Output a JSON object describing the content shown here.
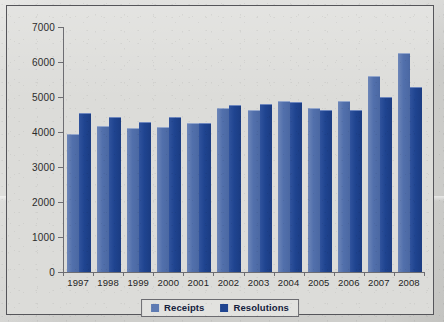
{
  "chart_data": {
    "type": "bar",
    "title": "",
    "xlabel": "",
    "ylabel": "",
    "categories": [
      "1997",
      "1998",
      "1999",
      "2000",
      "2001",
      "2002",
      "2003",
      "2004",
      "2005",
      "2006",
      "2007",
      "2008"
    ],
    "series": [
      {
        "name": "Receipts",
        "color": "#5e7bb3",
        "values": [
          3930,
          4180,
          4120,
          4130,
          4250,
          4690,
          4630,
          4880,
          4690,
          4900,
          5600,
          6270
        ]
      },
      {
        "name": "Resolutions",
        "color": "#1f4490",
        "values": [
          4540,
          4420,
          4300,
          4440,
          4250,
          4770,
          4810,
          4860,
          4620,
          4630,
          4990,
          5300
        ]
      }
    ],
    "ylim": [
      0,
      7000
    ],
    "ytick_labels": [
      "0",
      "1000",
      "2000",
      "3000",
      "4000",
      "5000",
      "6000",
      "7000"
    ],
    "ytick_values": [
      0,
      1000,
      2000,
      3000,
      4000,
      5000,
      6000,
      7000
    ],
    "grid": false,
    "legend_position": "bottom-center"
  },
  "legend": {
    "items": [
      {
        "label": "Receipts"
      },
      {
        "label": "Resolutions"
      }
    ]
  }
}
